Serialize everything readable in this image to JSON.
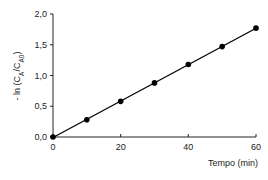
{
  "chart_data": {
    "type": "line",
    "title": "",
    "xlabel": "Tempo (min)",
    "ylabel": "- ln (C_A/C_A0)",
    "ylabel_parts": {
      "prefix": "- ln (C",
      "sub1": "A",
      "mid": "/C",
      "sub2": "A0",
      "suffix": ")"
    },
    "x_ticks": [
      "0",
      "20",
      "40",
      "60"
    ],
    "y_ticks": [
      "0,0",
      "0,5",
      "1,0",
      "1,5",
      "2,0"
    ],
    "xlim": [
      0,
      60
    ],
    "ylim": [
      0,
      2.0
    ],
    "grid": false,
    "legend": null,
    "series": [
      {
        "name": "data",
        "x": [
          0,
          10,
          20,
          30,
          40,
          50,
          60
        ],
        "y": [
          0.0,
          0.28,
          0.58,
          0.88,
          1.18,
          1.47,
          1.77
        ],
        "marker": "circle",
        "color": "#000000",
        "fit_line": true
      }
    ]
  }
}
